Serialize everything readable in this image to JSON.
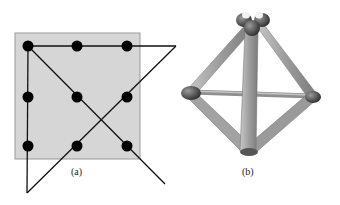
{
  "panel_a": {
    "label": "(a)",
    "square": {
      "x": 15,
      "y": 33,
      "w": 125,
      "h": 126,
      "fill": "#d6d6d6",
      "stroke": "#999999"
    },
    "dots": [
      [
        28,
        46
      ],
      [
        77,
        46
      ],
      [
        127,
        46
      ],
      [
        28,
        97
      ],
      [
        77,
        97
      ],
      [
        127,
        97
      ],
      [
        28,
        146
      ],
      [
        77,
        146
      ],
      [
        127,
        146
      ]
    ],
    "lines": [
      [
        [
          28,
          46
        ],
        [
          176,
          46
        ]
      ],
      [
        [
          176,
          46
        ],
        [
          27,
          193
        ]
      ],
      [
        [
          27,
          193
        ],
        [
          28,
          46
        ]
      ],
      [
        [
          28,
          46
        ],
        [
          165,
          184
        ]
      ]
    ],
    "dot_color": "#000000"
  },
  "panel_b": {
    "label": "(b)",
    "vertices": {
      "top": [
        251,
        26
      ],
      "left": [
        190,
        93
      ],
      "right": [
        313,
        97
      ],
      "bottom": [
        248,
        151
      ]
    },
    "rod_color": "#a9a9a9",
    "node_color": "#4a4a4a"
  }
}
